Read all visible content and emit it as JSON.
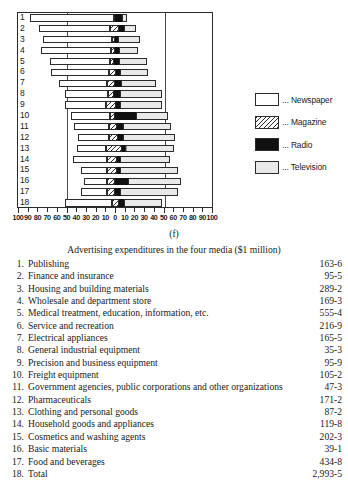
{
  "figure": {
    "label": "(f)",
    "caption": "Advertising expenditures in the four media ($1 million)"
  },
  "legend": {
    "position": "right",
    "items": [
      {
        "label": "... Newspaper",
        "key": "newspaper",
        "swatch": "white"
      },
      {
        "label": "... Magazine",
        "key": "magazine",
        "swatch": "hatched"
      },
      {
        "label": "... Radio",
        "key": "radio",
        "swatch": "black"
      },
      {
        "label": "... Television",
        "key": "television",
        "swatch": "stippled"
      }
    ]
  },
  "axis": {
    "tick_labels": [
      "100",
      "90",
      "80",
      "70",
      "60",
      "50",
      "40",
      "30",
      "20",
      "10",
      "0",
      "10",
      "20",
      "30",
      "40",
      "50",
      "60",
      "70",
      "80",
      "90",
      "100"
    ],
    "tick_values": [
      -100,
      -90,
      -80,
      -70,
      -60,
      -50,
      -40,
      -30,
      -20,
      -10,
      0,
      10,
      20,
      30,
      40,
      50,
      60,
      70,
      80,
      90,
      100
    ],
    "xlim": [
      -100,
      100
    ],
    "unit": "%"
  },
  "rows": [
    {
      "n": "1"
    },
    {
      "n": "2"
    },
    {
      "n": "3"
    },
    {
      "n": "4"
    },
    {
      "n": "5"
    },
    {
      "n": "6"
    },
    {
      "n": "7"
    },
    {
      "n": "8"
    },
    {
      "n": "9"
    },
    {
      "n": "10"
    },
    {
      "n": "11"
    },
    {
      "n": "12"
    },
    {
      "n": "13"
    },
    {
      "n": "14"
    },
    {
      "n": "15"
    },
    {
      "n": "16"
    },
    {
      "n": "17"
    },
    {
      "n": "18"
    }
  ],
  "chart_data": {
    "type": "bar",
    "orientation": "horizontal-stacked-diverging",
    "title": "Advertising expenditures in the four media ($1 million)",
    "xlabel": "%",
    "ylabel": "",
    "xlim": [
      -100,
      100
    ],
    "grid": false,
    "legend_position": "right",
    "note": "Each bar is a 100% composition split into four media. Bars are centred so that the Radio segment straddles the 0 axis; values below are percentage shares per industry.",
    "categories": [
      "1. Publishing",
      "2. Finance and insurance",
      "3. Housing and building materials",
      "4. Wholesale and department store",
      "5. Medical treatment, education, information, etc.",
      "6. Service and recreation",
      "7. Electrical appliances",
      "8. General industrial equipment",
      "9. Precision and business equipment",
      "10. Freight equipment",
      "11. Government agencies, public corporations and other organizations",
      "12. Pharmaceuticals",
      "13. Clothing and personal goods",
      "14. Household goods and appliances",
      "15. Cosmetics and washing agents",
      "16. Basic materials",
      "17. Food and beverages",
      "18. Total"
    ],
    "series": [
      {
        "name": "Newspaper",
        "values": [
          87,
          73,
          71,
          72,
          62,
          60,
          50,
          45,
          43,
          40,
          36,
          32,
          30,
          35,
          27,
          24,
          27,
          49
        ]
      },
      {
        "name": "Magazine",
        "values": [
          1,
          9,
          3,
          4,
          4,
          7,
          8,
          6,
          10,
          5,
          8,
          9,
          16,
          10,
          10,
          8,
          8,
          7
        ]
      },
      {
        "name": "Radio",
        "values": [
          7,
          5,
          3,
          4,
          5,
          4,
          6,
          6,
          4,
          22,
          6,
          5,
          3,
          3,
          3,
          13,
          5,
          5
        ]
      },
      {
        "name": "Television",
        "values": [
          5,
          13,
          23,
          20,
          29,
          29,
          36,
          43,
          43,
          33,
          50,
          54,
          51,
          52,
          60,
          55,
          60,
          39
        ]
      }
    ],
    "bar_geometry": [
      {
        "n": "1",
        "newspaper_start": -88,
        "newspaper_end": -1,
        "magazine_end": 0,
        "radio_end": 7,
        "television_end": 12
      },
      {
        "n": "2",
        "newspaper_start": -78,
        "newspaper_end": -5,
        "magazine_end": 4,
        "radio_end": 9,
        "television_end": 22
      },
      {
        "n": "3",
        "newspaper_start": -74,
        "newspaper_end": -3,
        "magazine_end": 0,
        "radio_end": 3,
        "television_end": 26
      },
      {
        "n": "4",
        "newspaper_start": -76,
        "newspaper_end": -4,
        "magazine_end": 0,
        "radio_end": 4,
        "television_end": 24
      },
      {
        "n": "5",
        "newspaper_start": -67,
        "newspaper_end": -5,
        "magazine_end": -1,
        "radio_end": 4,
        "television_end": 33
      },
      {
        "n": "6",
        "newspaper_start": -66,
        "newspaper_end": -6,
        "magazine_end": 1,
        "radio_end": 5,
        "television_end": 34
      },
      {
        "n": "7",
        "newspaper_start": -58,
        "newspaper_end": -8,
        "magazine_end": 0,
        "radio_end": 6,
        "television_end": 42
      },
      {
        "n": "8",
        "newspaper_start": -52,
        "newspaper_end": -7,
        "magazine_end": -1,
        "radio_end": 5,
        "television_end": 48
      },
      {
        "n": "9",
        "newspaper_start": -52,
        "newspaper_end": -9,
        "magazine_end": 1,
        "radio_end": 5,
        "television_end": 48
      },
      {
        "n": "10",
        "newspaper_start": -45,
        "newspaper_end": -5,
        "magazine_end": 0,
        "radio_end": 22,
        "television_end": 55
      },
      {
        "n": "11",
        "newspaper_start": -42,
        "newspaper_end": -6,
        "magazine_end": 2,
        "radio_end": 8,
        "television_end": 58
      },
      {
        "n": "12",
        "newspaper_start": -38,
        "newspaper_end": -6,
        "magazine_end": 3,
        "radio_end": 8,
        "television_end": 62
      },
      {
        "n": "13",
        "newspaper_start": -39,
        "newspaper_end": -9,
        "magazine_end": 7,
        "radio_end": 10,
        "television_end": 61
      },
      {
        "n": "14",
        "newspaper_start": -43,
        "newspaper_end": -8,
        "magazine_end": 2,
        "radio_end": 5,
        "television_end": 57
      },
      {
        "n": "15",
        "newspaper_start": -35,
        "newspaper_end": -8,
        "magazine_end": 2,
        "radio_end": 5,
        "television_end": 65
      },
      {
        "n": "16",
        "newspaper_start": -32,
        "newspaper_end": -8,
        "magazine_end": 0,
        "radio_end": 13,
        "television_end": 68
      },
      {
        "n": "17",
        "newspaper_start": -35,
        "newspaper_end": -8,
        "magazine_end": 0,
        "radio_end": 5,
        "television_end": 65
      },
      {
        "n": "18",
        "newspaper_start": -52,
        "newspaper_end": -3,
        "magazine_end": 4,
        "radio_end": 9,
        "television_end": 48
      }
    ]
  },
  "list": {
    "items": [
      {
        "num": "1.",
        "name": "Publishing",
        "value": "163-6"
      },
      {
        "num": "2.",
        "name": "Finance and insurance",
        "value": "95-5"
      },
      {
        "num": "3.",
        "name": "Housing and building materials",
        "value": "289-2"
      },
      {
        "num": "4.",
        "name": "Wholesale and department store",
        "value": "169-3"
      },
      {
        "num": "5.",
        "name": "Medical treatment, education, information, etc.",
        "value": "555-4"
      },
      {
        "num": "6.",
        "name": "Service and recreation",
        "value": "216-9"
      },
      {
        "num": "7.",
        "name": "Electrical appliances",
        "value": "165-5"
      },
      {
        "num": "8.",
        "name": "General industrial equipment",
        "value": "35-3"
      },
      {
        "num": "9.",
        "name": "Precision and business equipment",
        "value": "95-9"
      },
      {
        "num": "10.",
        "name": "Freight equipment",
        "value": "105-2"
      },
      {
        "num": "11.",
        "name": "Government agencies, public corporations and other organizations",
        "value": "47-3"
      },
      {
        "num": "12.",
        "name": "Pharmaceuticals",
        "value": "171-2"
      },
      {
        "num": "13.",
        "name": "Clothing and personal goods",
        "value": "87-2"
      },
      {
        "num": "14.",
        "name": "Household goods and appliances",
        "value": "119-8"
      },
      {
        "num": "15.",
        "name": "Cosmetics and washing agents",
        "value": "202-3"
      },
      {
        "num": "16.",
        "name": "Basic materials",
        "value": "39-1"
      },
      {
        "num": "17.",
        "name": "Food and beverages",
        "value": "434-8"
      },
      {
        "num": "18.",
        "name": "Total",
        "value": "2,993-5"
      }
    ]
  }
}
